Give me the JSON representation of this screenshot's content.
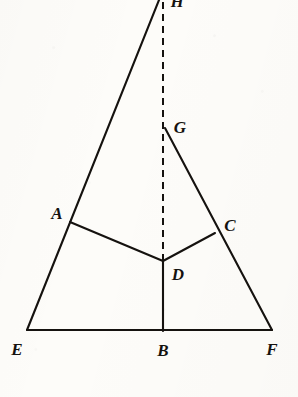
{
  "figure": {
    "kind": "geometry-diagram",
    "canvas": {
      "width": 298,
      "height": 397
    },
    "background_color": "#fdfcf9",
    "ink_color": "#15120f",
    "stroke_width": 2.0,
    "dash_pattern": "7 5"
  },
  "points": [
    {
      "id": "H",
      "label": "H",
      "x": 163,
      "y": -10,
      "label_x": 177,
      "label_y": 1,
      "clipped": true
    },
    {
      "id": "G",
      "label": "G",
      "x": 165,
      "y": 128,
      "label_x": 180,
      "label_y": 127,
      "clipped": false
    },
    {
      "id": "A",
      "label": "A",
      "x": 70,
      "y": 222,
      "label_x": 57,
      "label_y": 213,
      "clipped": false
    },
    {
      "id": "C",
      "label": "C",
      "x": 215,
      "y": 233,
      "label_x": 230,
      "label_y": 225,
      "clipped": false
    },
    {
      "id": "D",
      "label": "D",
      "x": 163,
      "y": 261,
      "label_x": 178,
      "label_y": 274,
      "clipped": false
    },
    {
      "id": "E",
      "label": "E",
      "x": 27,
      "y": 330,
      "label_x": 17,
      "label_y": 349,
      "clipped": false
    },
    {
      "id": "B",
      "label": "B",
      "x": 163,
      "y": 331,
      "label_x": 163,
      "label_y": 350,
      "clipped": false
    },
    {
      "id": "F",
      "label": "F",
      "x": 272,
      "y": 330,
      "label_x": 272,
      "label_y": 349,
      "clipped": false
    }
  ],
  "segments": [
    {
      "id": "EH",
      "from": "E",
      "to": "H",
      "style": "solid",
      "note": "left side of large triangle, passes through A"
    },
    {
      "id": "GF",
      "from": "G",
      "to": "F",
      "style": "solid",
      "note": "right side, passes through C"
    },
    {
      "id": "EF",
      "from": "E",
      "to": "F",
      "style": "solid",
      "note": "base of the large triangle"
    },
    {
      "id": "AD",
      "from": "A",
      "to": "D",
      "style": "solid",
      "note": ""
    },
    {
      "id": "CD",
      "from": "C",
      "to": "D",
      "style": "solid",
      "note": ""
    },
    {
      "id": "DB",
      "from": "D",
      "to": "B",
      "style": "solid",
      "note": ""
    },
    {
      "id": "HD",
      "from": "H",
      "to": "D",
      "style": "dashed",
      "note": "vertical dashed axis from apex down to interior point D"
    }
  ]
}
